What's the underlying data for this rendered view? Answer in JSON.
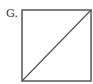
{
  "figure": {
    "label": "G.",
    "shape": "square",
    "diagonal": "bottom-left to top-right",
    "stroke_color": "#555555",
    "square": {
      "x": 22,
      "y": 10,
      "width": 69,
      "height": 71
    },
    "diagonal_line": {
      "x1": 22,
      "y1": 81,
      "x2": 91,
      "y2": 10
    }
  }
}
